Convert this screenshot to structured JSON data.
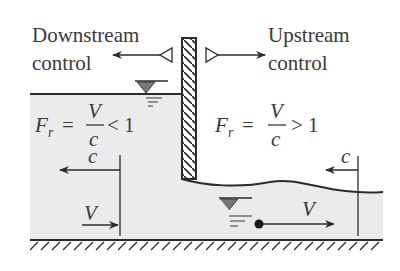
{
  "diagram": {
    "labels": {
      "downstream_control_line1": "Downstream",
      "downstream_control_line2": "control",
      "upstream_control_line1": "Upstream",
      "upstream_control_line2": "control"
    },
    "left_region": {
      "froude_F": "F",
      "froude_sub": "r",
      "equals": "=",
      "numerator": "V",
      "denominator": "c",
      "relation": "< 1",
      "wave_speed_label": "c",
      "velocity_label": "V"
    },
    "right_region": {
      "froude_F": "F",
      "froude_sub": "r",
      "equals": "=",
      "numerator": "V",
      "denominator": "c",
      "relation": "> 1",
      "wave_speed_label": "c",
      "velocity_label": "V"
    },
    "colors": {
      "water": "#ebebeb",
      "line": "#2b2b2b",
      "text": "#3a3a3a",
      "background": "#ffffff"
    }
  }
}
